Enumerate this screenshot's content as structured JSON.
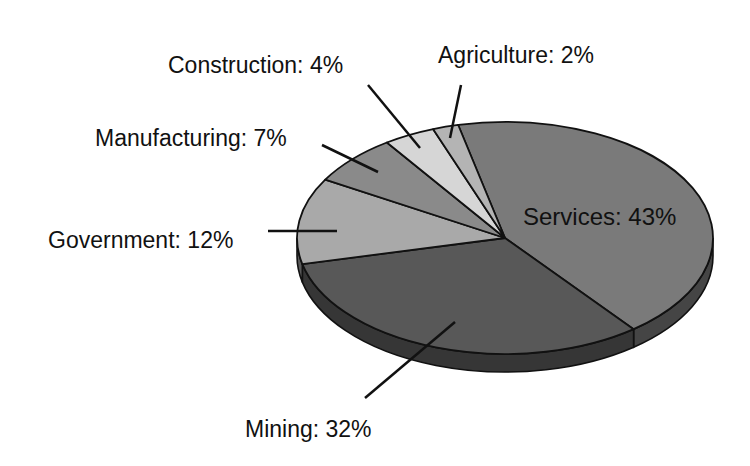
{
  "chart_data": {
    "type": "pie",
    "style": "3d-tilted",
    "title": "",
    "categories": [
      "Services",
      "Mining",
      "Government",
      "Manufacturing",
      "Construction",
      "Agriculture"
    ],
    "values": [
      43,
      32,
      12,
      7,
      4,
      2
    ],
    "unit": "%",
    "labels": [
      "Services: 43%",
      "Mining: 32%",
      "Government: 12%",
      "Manufacturing: 7%",
      "Construction: 4%",
      "Agriculture: 2%"
    ],
    "colors": [
      "#7a7a7a",
      "#585858",
      "#a9a9a9",
      "#8a8a8a",
      "#d6d6d6",
      "#b4b4b4"
    ],
    "side_colors": [
      "#454545",
      "#363636",
      "#5a5a5a",
      "#4a4a4a",
      "#6a6a6a",
      "#5a5a5a"
    ],
    "legend": "none (callout labels)"
  },
  "labels": {
    "services": "Services: 43%",
    "mining": "Mining: 32%",
    "government": "Government: 12%",
    "manufacturing": "Manufacturing: 7%",
    "construction": "Construction: 4%",
    "agriculture": "Agriculture: 2%"
  }
}
